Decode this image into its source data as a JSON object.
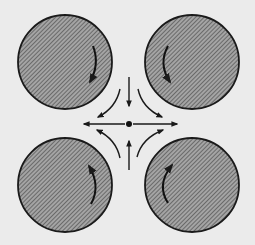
{
  "diagram": {
    "colors": {
      "background": "#ebebeb",
      "disc_fill": "#9a9a9a",
      "hatch": "#555555",
      "stroke": "#1a1a1a"
    },
    "center_point": {
      "x": 129,
      "y": 124
    },
    "discs": [
      {
        "id": "top-left",
        "cx": 65,
        "cy": 62,
        "r": 47,
        "rotation": "clockwise"
      },
      {
        "id": "top-right",
        "cx": 192,
        "cy": 62,
        "r": 47,
        "rotation": "counterclockwise"
      },
      {
        "id": "bottom-left",
        "cx": 65,
        "cy": 185,
        "r": 47,
        "rotation": "counterclockwise"
      },
      {
        "id": "bottom-right",
        "cx": 192,
        "cy": 185,
        "r": 47,
        "rotation": "clockwise"
      }
    ],
    "flow_arrows": {
      "inflow": [
        "from-top-pointing-down",
        "from-bottom-pointing-up"
      ],
      "outflow": [
        "to-left",
        "to-right"
      ],
      "curved": [
        "top-left-down-left",
        "top-right-down-right",
        "bottom-left-up-left",
        "bottom-right-up-right"
      ]
    }
  }
}
